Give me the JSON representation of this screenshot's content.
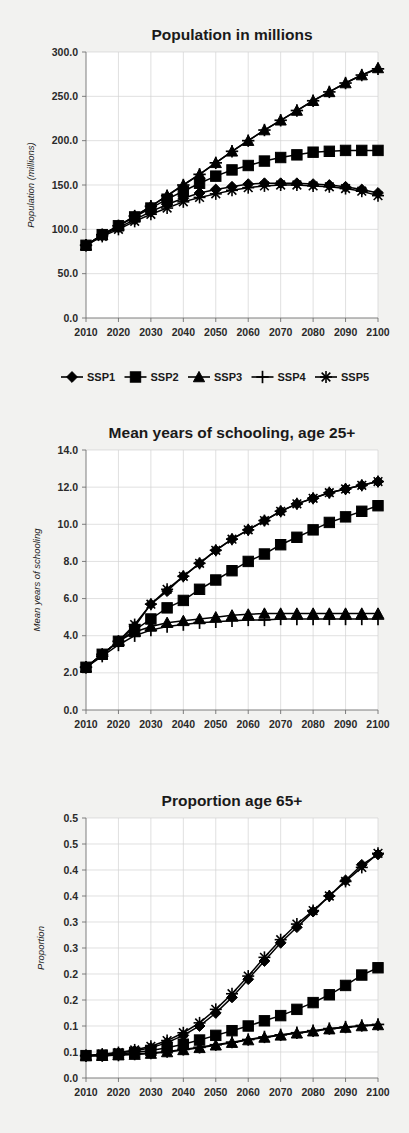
{
  "figure": {
    "background_color": "#f2f2f0",
    "plot_background_color": "#ffffff",
    "series_color": "#000000",
    "grid_color": "#d2d2d2"
  },
  "legend": {
    "position": "below-first-chart",
    "entries": [
      {
        "label": "SSP1",
        "marker": "diamond"
      },
      {
        "label": "SSP2",
        "marker": "square"
      },
      {
        "label": "SSP3",
        "marker": "triangle"
      },
      {
        "label": "SSP4",
        "marker": "plus"
      },
      {
        "label": "SSP5",
        "marker": "asterisk"
      }
    ]
  },
  "chart_data": [
    {
      "type": "line",
      "title": "Population in millions",
      "xlabel": "",
      "ylabel": "Population (millions)",
      "xlim": [
        2010,
        2100
      ],
      "ylim": [
        0,
        300
      ],
      "ytick_labels": [
        "0.0",
        "50.0",
        "100.0",
        "150.0",
        "200.0",
        "250.0",
        "300.0"
      ],
      "ytick_values": [
        0,
        50,
        100,
        150,
        200,
        250,
        300
      ],
      "xtick_labels": [
        "2010",
        "2020",
        "2030",
        "2040",
        "2050",
        "2060",
        "2070",
        "2080",
        "2090",
        "2100"
      ],
      "xtick_values": [
        2010,
        2020,
        2030,
        2040,
        2050,
        2060,
        2070,
        2080,
        2090,
        2100
      ],
      "grid": true,
      "legend_position": "bottom",
      "x": [
        2010,
        2015,
        2020,
        2025,
        2030,
        2035,
        2040,
        2045,
        2050,
        2055,
        2060,
        2065,
        2070,
        2075,
        2080,
        2085,
        2090,
        2095,
        2100
      ],
      "series": [
        {
          "name": "SSP1",
          "marker": "diamond",
          "values": [
            82,
            93,
            102,
            111,
            120,
            128,
            135,
            141,
            145,
            148,
            151,
            152,
            152,
            152,
            151,
            150,
            148,
            145,
            141
          ]
        },
        {
          "name": "SSP2",
          "marker": "square",
          "values": [
            82,
            94,
            104,
            114,
            124,
            134,
            143,
            152,
            160,
            167,
            172,
            177,
            181,
            184,
            187,
            188,
            189,
            189,
            189
          ]
        },
        {
          "name": "SSP3",
          "marker": "triangle",
          "values": [
            82,
            94,
            104,
            115,
            126,
            138,
            150,
            162,
            175,
            188,
            200,
            212,
            223,
            234,
            245,
            255,
            265,
            274,
            282
          ]
        },
        {
          "name": "SSP4",
          "marker": "plus",
          "values": [
            82,
            94,
            104,
            115,
            126,
            138,
            150,
            162,
            175,
            188,
            200,
            212,
            223,
            234,
            245,
            255,
            265,
            274,
            281
          ]
        },
        {
          "name": "SSP5",
          "marker": "asterisk",
          "values": [
            82,
            92,
            100,
            109,
            117,
            124,
            131,
            136,
            140,
            144,
            147,
            149,
            150,
            150,
            149,
            148,
            146,
            143,
            138
          ]
        }
      ]
    },
    {
      "type": "line",
      "title": "Mean years of schooling, age 25+",
      "xlabel": "",
      "ylabel": "Mean years of schooling",
      "xlim": [
        2010,
        2100
      ],
      "ylim": [
        0,
        14
      ],
      "ytick_labels": [
        "0.0",
        "2.0",
        "4.0",
        "6.0",
        "8.0",
        "10.0",
        "12.0",
        "14.0"
      ],
      "ytick_values": [
        0,
        2,
        4,
        6,
        8,
        10,
        12,
        14
      ],
      "xtick_labels": [
        "2010",
        "2020",
        "2030",
        "2040",
        "2050",
        "2060",
        "2070",
        "2080",
        "2090",
        "2100"
      ],
      "xtick_values": [
        2010,
        2020,
        2030,
        2040,
        2050,
        2060,
        2070,
        2080,
        2090,
        2100
      ],
      "grid": true,
      "x": [
        2010,
        2015,
        2020,
        2025,
        2030,
        2035,
        2040,
        2045,
        2050,
        2055,
        2060,
        2065,
        2070,
        2075,
        2080,
        2085,
        2090,
        2095,
        2100
      ],
      "series": [
        {
          "name": "SSP1",
          "marker": "diamond",
          "values": [
            2.3,
            3.0,
            3.7,
            4.5,
            5.7,
            6.4,
            7.2,
            7.9,
            8.6,
            9.2,
            9.7,
            10.2,
            10.7,
            11.1,
            11.4,
            11.7,
            11.9,
            12.1,
            12.3
          ]
        },
        {
          "name": "SSP2",
          "marker": "square",
          "values": [
            2.3,
            3.0,
            3.7,
            4.3,
            4.9,
            5.5,
            5.9,
            6.5,
            7.0,
            7.5,
            8.0,
            8.4,
            8.9,
            9.3,
            9.7,
            10.1,
            10.4,
            10.7,
            11.0
          ]
        },
        {
          "name": "SSP3",
          "marker": "triangle",
          "values": [
            2.3,
            3.0,
            3.7,
            4.2,
            4.5,
            4.7,
            4.8,
            4.9,
            5.0,
            5.1,
            5.15,
            5.2,
            5.2,
            5.2,
            5.2,
            5.2,
            5.2,
            5.2,
            5.2
          ]
        },
        {
          "name": "SSP4",
          "marker": "plus",
          "values": [
            2.3,
            2.9,
            3.5,
            4.0,
            4.3,
            4.5,
            4.6,
            4.7,
            4.75,
            4.8,
            4.85,
            4.85,
            4.9,
            4.9,
            4.9,
            4.9,
            4.9,
            4.9,
            4.9
          ]
        },
        {
          "name": "SSP5",
          "marker": "asterisk",
          "values": [
            2.3,
            3.0,
            3.7,
            4.6,
            5.7,
            6.5,
            7.2,
            7.9,
            8.6,
            9.2,
            9.7,
            10.2,
            10.7,
            11.1,
            11.4,
            11.7,
            11.9,
            12.1,
            12.3
          ]
        }
      ]
    },
    {
      "type": "line",
      "title": "Proportion age 65+",
      "xlabel": "",
      "ylabel": "Proportion",
      "xlim": [
        2010,
        2100
      ],
      "ylim": [
        0,
        0.5
      ],
      "ytick_labels": [
        "0.0",
        "0.1",
        "0.1",
        "0.2",
        "0.2",
        "0.3",
        "0.3",
        "0.4",
        "0.4",
        "0.5",
        "0.5"
      ],
      "ytick_values": [
        0,
        0.05,
        0.1,
        0.15,
        0.2,
        0.25,
        0.3,
        0.35,
        0.4,
        0.45,
        0.5
      ],
      "xtick_labels": [
        "2010",
        "2020",
        "2030",
        "2040",
        "2050",
        "2060",
        "2070",
        "2080",
        "2090",
        "2100"
      ],
      "xtick_values": [
        2010,
        2020,
        2030,
        2040,
        2050,
        2060,
        2070,
        2080,
        2090,
        2100
      ],
      "grid": true,
      "x": [
        2010,
        2015,
        2020,
        2025,
        2030,
        2035,
        2040,
        2045,
        2050,
        2055,
        2060,
        2065,
        2070,
        2075,
        2080,
        2085,
        2090,
        2095,
        2100
      ],
      "series": [
        {
          "name": "SSP1",
          "marker": "diamond",
          "values": [
            0.043,
            0.045,
            0.048,
            0.052,
            0.058,
            0.068,
            0.082,
            0.1,
            0.125,
            0.155,
            0.19,
            0.225,
            0.26,
            0.29,
            0.32,
            0.35,
            0.38,
            0.41,
            0.43
          ]
        },
        {
          "name": "SSP2",
          "marker": "square",
          "values": [
            0.043,
            0.044,
            0.046,
            0.049,
            0.053,
            0.058,
            0.065,
            0.073,
            0.082,
            0.091,
            0.1,
            0.11,
            0.12,
            0.132,
            0.145,
            0.16,
            0.178,
            0.198,
            0.212
          ]
        },
        {
          "name": "SSP3",
          "marker": "triangle",
          "values": [
            0.043,
            0.043,
            0.044,
            0.045,
            0.047,
            0.05,
            0.054,
            0.058,
            0.063,
            0.068,
            0.073,
            0.078,
            0.082,
            0.086,
            0.09,
            0.094,
            0.097,
            0.1,
            0.102
          ]
        },
        {
          "name": "SSP4",
          "marker": "plus",
          "values": [
            0.043,
            0.043,
            0.044,
            0.046,
            0.048,
            0.051,
            0.055,
            0.059,
            0.064,
            0.069,
            0.074,
            0.079,
            0.083,
            0.087,
            0.091,
            0.095,
            0.098,
            0.101,
            0.103
          ]
        },
        {
          "name": "SSP5",
          "marker": "asterisk",
          "values": [
            0.043,
            0.046,
            0.049,
            0.054,
            0.061,
            0.072,
            0.087,
            0.106,
            0.132,
            0.162,
            0.196,
            0.232,
            0.266,
            0.296,
            0.322,
            0.35,
            0.378,
            0.405,
            0.432
          ]
        }
      ]
    }
  ]
}
